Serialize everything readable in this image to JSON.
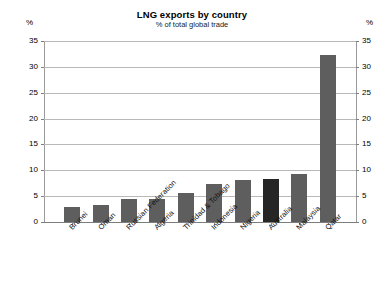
{
  "chart_data": {
    "type": "bar",
    "title": "LNG exports by country",
    "subtitle": "% of total global trade",
    "xlabel": "",
    "ylabel": "%",
    "y_unit_left": "%",
    "y_unit_right": "%",
    "ylim": [
      0,
      35
    ],
    "yticks": [
      0,
      5,
      10,
      15,
      20,
      25,
      30,
      35
    ],
    "grid": true,
    "legend": "none",
    "dual_axis": true,
    "categories": [
      "Brunei",
      "Oman",
      "Russian Federation",
      "Algeria",
      "Trinidad & Tobago",
      "Indonesia",
      "Nigeria",
      "Australia",
      "Malaysia",
      "Qatar"
    ],
    "values": [
      2.9,
      3.3,
      4.4,
      4.5,
      5.7,
      7.4,
      8.1,
      8.3,
      9.3,
      32.2
    ],
    "highlight_category": "Australia",
    "colors": {
      "bar": "#5e5e5e",
      "bar_highlight": "#262626",
      "gridline": "#b9b9b9",
      "axis": "#7d7d7d",
      "background": "#ffffff",
      "text": "#000000"
    }
  }
}
